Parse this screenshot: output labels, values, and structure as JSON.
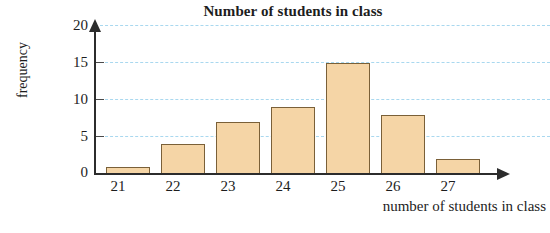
{
  "chart_data": {
    "type": "bar",
    "title": "Number of students in class",
    "xlabel": "number of students in class",
    "ylabel": "frequency",
    "categories": [
      "21",
      "22",
      "23",
      "24",
      "25",
      "26",
      "27"
    ],
    "values": [
      1,
      4,
      7,
      9,
      15,
      8,
      2
    ],
    "series": [
      {
        "name": "frequency",
        "values": [
          1,
          4,
          7,
          9,
          15,
          8,
          2
        ]
      }
    ],
    "ylim": [
      0,
      20
    ],
    "y_ticks": [
      0,
      5,
      10,
      15,
      20
    ],
    "y_tick_labels": [
      "0",
      "5",
      "10",
      "15",
      "20"
    ],
    "grid": "horizontal-dashed",
    "legend": "none",
    "colors": {
      "bar_fill": "#f5d5a6",
      "bar_border": "#7a6038",
      "gridline": "#a9d8ef",
      "axis": "#2c2c2c",
      "text": "#1d1d1d",
      "background": "#ffffff"
    }
  }
}
